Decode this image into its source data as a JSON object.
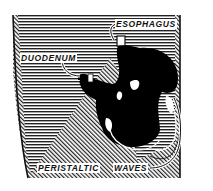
{
  "figure": {
    "colors": {
      "ink": "#111111",
      "background": "#ffffff",
      "stomach_fill": "#000000"
    },
    "labels": {
      "esophagus": "ESOPHAGUS",
      "duodenum": "DUODENUM",
      "peristaltic": "PERISTALTIC",
      "waves": "WAVES"
    }
  }
}
